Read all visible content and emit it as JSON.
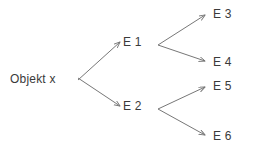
{
  "diagram": {
    "type": "tree",
    "background_color": "#ffffff",
    "edge_color": "#777777",
    "text_color": "#3a3a3a",
    "nodes": {
      "root": {
        "id": "root",
        "label": "Objekt x",
        "level": 0,
        "x": 10,
        "y": 79
      },
      "e1": {
        "id": "E1",
        "label": "E 1",
        "level": 1,
        "x": 123,
        "y": 42
      },
      "e2": {
        "id": "E2",
        "label": "E 2",
        "level": 1,
        "x": 123,
        "y": 106
      },
      "e3": {
        "id": "E3",
        "label": "E 3",
        "level": 2,
        "x": 213,
        "y": 14
      },
      "e4": {
        "id": "E4",
        "label": "E 4",
        "level": 2,
        "x": 213,
        "y": 62
      },
      "e5": {
        "id": "E5",
        "label": "E 5",
        "level": 2,
        "x": 213,
        "y": 86
      },
      "e6": {
        "id": "E6",
        "label": "E 6",
        "level": 2,
        "x": 213,
        "y": 136
      }
    },
    "edges": [
      {
        "from": "root",
        "to": "E1",
        "arrow": true,
        "x1": 78,
        "y1": 80,
        "x2": 120,
        "y2": 42
      },
      {
        "from": "root",
        "to": "E2",
        "arrow": true,
        "x1": 78,
        "y1": 78,
        "x2": 120,
        "y2": 106
      },
      {
        "from": "E1",
        "to": "E3",
        "arrow": true,
        "x1": 158,
        "y1": 45,
        "x2": 208,
        "y2": 14
      },
      {
        "from": "E1",
        "to": "E4",
        "arrow": true,
        "x1": 158,
        "y1": 45,
        "x2": 208,
        "y2": 62
      },
      {
        "from": "E2",
        "to": "E5",
        "arrow": true,
        "x1": 158,
        "y1": 109,
        "x2": 208,
        "y2": 86
      },
      {
        "from": "E2",
        "to": "E6",
        "arrow": true,
        "x1": 158,
        "y1": 109,
        "x2": 208,
        "y2": 136
      }
    ]
  }
}
